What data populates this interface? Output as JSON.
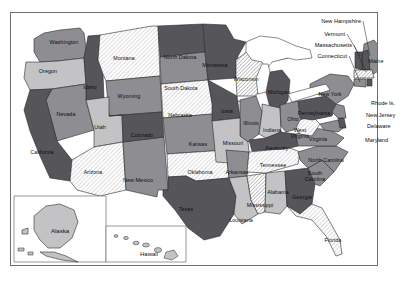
{
  "map": {
    "title": "United States choropleth map",
    "frame": {
      "border_color": "#6e6e6e",
      "background": "#ffffff"
    },
    "fill_classes": {
      "dark": "#55555a",
      "mid": "#8d8d92",
      "light": "#c3c3c6",
      "hatch_light": "#f2f2f2",
      "hatch_mid": "#dcdcdc",
      "water": "#ffffff",
      "outline": "#2b2b2b"
    },
    "states": [
      {
        "code": "WA",
        "name": "Washington",
        "fill": "mid",
        "label_x": 64,
        "label_y": 42
      },
      {
        "code": "OR",
        "name": "Oregon",
        "fill": "light",
        "label_x": 48,
        "label_y": 71
      },
      {
        "code": "ID",
        "name": "Idaho",
        "fill": "dark",
        "label_x": 90,
        "label_y": 87
      },
      {
        "code": "MT",
        "name": "Montana",
        "fill": "hatch_light",
        "label_x": 124,
        "label_y": 58
      },
      {
        "code": "ND",
        "name": "North Dakota",
        "fill": "dark",
        "label_x": 180,
        "label_y": 57
      },
      {
        "code": "SD",
        "name": "South Dakota",
        "fill": "mid",
        "label_x": 181,
        "label_y": 88
      },
      {
        "code": "WY",
        "name": "Wyoming",
        "fill": "mid",
        "label_x": 129,
        "label_y": 96
      },
      {
        "code": "NE",
        "name": "Nebraska",
        "fill": "hatch_light",
        "label_x": 180,
        "label_y": 115
      },
      {
        "code": "NV",
        "name": "Nevada",
        "fill": "mid",
        "label_x": 66,
        "label_y": 114
      },
      {
        "code": "UT",
        "name": "Utah",
        "fill": "light",
        "label_x": 100,
        "label_y": 127
      },
      {
        "code": "CO",
        "name": "Colorado",
        "fill": "dark",
        "label_x": 142,
        "label_y": 135
      },
      {
        "code": "CA",
        "name": "California",
        "fill": "dark",
        "label_x": 42,
        "label_y": 152
      },
      {
        "code": "AZ",
        "name": "Arizona",
        "fill": "hatch_light",
        "label_x": 93,
        "label_y": 172
      },
      {
        "code": "NM",
        "name": "New Mexico",
        "fill": "mid",
        "label_x": 138,
        "label_y": 180
      },
      {
        "code": "KS",
        "name": "Kansas",
        "fill": "mid",
        "label_x": 198,
        "label_y": 144
      },
      {
        "code": "OK",
        "name": "Oklahoma",
        "fill": "hatch_light",
        "label_x": 200,
        "label_y": 172
      },
      {
        "code": "TX",
        "name": "Texas",
        "fill": "dark",
        "label_x": 186,
        "label_y": 209
      },
      {
        "code": "MN",
        "name": "Minnesota",
        "fill": "dark",
        "label_x": 215,
        "label_y": 65
      },
      {
        "code": "IA",
        "name": "Iowa",
        "fill": "dark",
        "label_x": 227,
        "label_y": 111
      },
      {
        "code": "WI",
        "name": "Wisconsin",
        "fill": "hatch_mid",
        "label_x": 246,
        "label_y": 79
      },
      {
        "code": "MI",
        "name": "Michigan",
        "fill": "dark",
        "label_x": 279,
        "label_y": 92
      },
      {
        "code": "MO",
        "name": "Missouri",
        "fill": "light",
        "label_x": 233,
        "label_y": 143
      },
      {
        "code": "IL",
        "name": "Illinois",
        "fill": "mid",
        "label_x": 251,
        "label_y": 123
      },
      {
        "code": "IN",
        "name": "Indiana",
        "fill": "light",
        "label_x": 272,
        "label_y": 130
      },
      {
        "code": "OH",
        "name": "Ohio",
        "fill": "mid",
        "label_x": 293,
        "label_y": 119
      },
      {
        "code": "KY",
        "name": "Kentucky",
        "fill": "dark",
        "label_x": 277,
        "label_y": 148
      },
      {
        "code": "TN",
        "name": "Tennessee",
        "fill": "hatch_light",
        "label_x": 273,
        "label_y": 165
      },
      {
        "code": "AR",
        "name": "Arkansas",
        "fill": "mid",
        "label_x": 237,
        "label_y": 172
      },
      {
        "code": "LA",
        "name": "Louisiana",
        "fill": "light",
        "label_x": 241,
        "label_y": 220
      },
      {
        "code": "MS",
        "name": "Mississippi",
        "fill": "hatch_mid",
        "label_x": 260,
        "label_y": 205
      },
      {
        "code": "AL",
        "name": "Alabama",
        "fill": "light",
        "label_x": 278,
        "label_y": 192
      },
      {
        "code": "GA",
        "name": "Georgia",
        "fill": "dark",
        "label_x": 302,
        "label_y": 197
      },
      {
        "code": "FL",
        "name": "Florida",
        "fill": "hatch_light",
        "label_x": 333,
        "label_y": 240
      },
      {
        "code": "SC",
        "name": "South Carolina",
        "fill": "mid",
        "label_x": 315,
        "label_y": 176
      },
      {
        "code": "NC",
        "name": "North Carolina",
        "fill": "mid",
        "label_x": 326,
        "label_y": 160
      },
      {
        "code": "VA",
        "name": "Virginia",
        "fill": "mid",
        "label_x": 318,
        "label_y": 139
      },
      {
        "code": "WV",
        "name": "West Virginia",
        "fill": "hatch_light",
        "label_x": 300,
        "label_y": 133
      },
      {
        "code": "PA",
        "name": "Pennsylvania",
        "fill": "dark",
        "label_x": 314,
        "label_y": 113
      },
      {
        "code": "NY",
        "name": "New York",
        "fill": "mid",
        "label_x": 330,
        "label_y": 94
      },
      {
        "code": "ME",
        "name": "Maine",
        "fill": "mid",
        "label_x": 376,
        "label_y": 61
      }
    ],
    "callouts": [
      {
        "name": "New Hampshire",
        "text_x": 361,
        "text_y": 21,
        "line_to_x": 368,
        "line_to_y": 56
      },
      {
        "name": "Vermont",
        "text_x": 345,
        "text_y": 34,
        "line_to_x": 363,
        "line_to_y": 57
      },
      {
        "name": "Massachusetts",
        "text_x": 352,
        "text_y": 45,
        "line_to_x": 370,
        "line_to_y": 64
      },
      {
        "name": "Connecticut",
        "text_x": 347,
        "text_y": 56,
        "line_to_x": 365,
        "line_to_y": 70
      }
    ],
    "right_labels": [
      {
        "name": "Rhode Is.",
        "text_x": 371,
        "text_y": 103
      },
      {
        "name": "New Jersey",
        "text_x": 366,
        "text_y": 115
      },
      {
        "name": "Delaware",
        "text_x": 367,
        "text_y": 126
      },
      {
        "name": "Maryland",
        "text_x": 365,
        "text_y": 140
      }
    ],
    "insets": [
      {
        "name": "Alaska",
        "label_x": 60,
        "label_y": 231,
        "fill": "light"
      },
      {
        "name": "Hawaii",
        "label_x": 149,
        "label_y": 254,
        "fill": "light"
      }
    ]
  }
}
